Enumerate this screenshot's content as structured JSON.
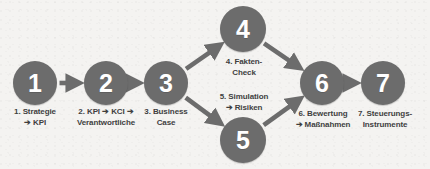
{
  "diagram": {
    "background_color": "#f4f3f1",
    "node_color": "#6c6c6c",
    "node_number_color": "#ffffff",
    "label_color": "#3f3f3f",
    "arrow_color": "#6c6c6c",
    "type": "flow",
    "nodes": [
      {
        "id": "node-1",
        "number": "1",
        "label": "1. Strategie\n➔ KPI",
        "cx": 35,
        "cy": 83,
        "r": 22,
        "label_x": 0,
        "label_y": 107,
        "label_w": 70
      },
      {
        "id": "node-2",
        "number": "2",
        "label": "2. KPI ➔ KCI ➔\nVerantwortliche",
        "cx": 106,
        "cy": 83,
        "r": 22,
        "label_x": 64,
        "label_y": 107,
        "label_w": 84
      },
      {
        "id": "node-3",
        "number": "3",
        "label": "3. Business\nCase",
        "cx": 166,
        "cy": 83,
        "r": 22,
        "label_x": 131,
        "label_y": 107,
        "label_w": 70
      },
      {
        "id": "node-4",
        "number": "4",
        "label": "4. Fakten-\nCheck",
        "cx": 243,
        "cy": 29,
        "r": 23,
        "label_x": 214,
        "label_y": 57,
        "label_w": 60
      },
      {
        "id": "node-5",
        "number": "5",
        "label": "5. Simulation\n➔ Risiken",
        "cx": 243,
        "cy": 140,
        "r": 23,
        "label_x": 210,
        "label_y": 92,
        "label_w": 68
      },
      {
        "id": "node-6",
        "number": "6",
        "label": "6. Bewertung\n➔ Maßnahmen",
        "cx": 322,
        "cy": 83,
        "r": 22,
        "label_x": 283,
        "label_y": 109,
        "label_w": 80
      },
      {
        "id": "node-7",
        "number": "7",
        "label": "7. Steuerungs-\nInstrumente",
        "cx": 383,
        "cy": 83,
        "r": 22,
        "label_x": 347,
        "label_y": 109,
        "label_w": 76
      }
    ],
    "edges": [
      {
        "id": "edge-1-2",
        "from": "node-1",
        "to": "node-2"
      },
      {
        "id": "edge-2-3",
        "from": "node-2",
        "to": "node-3"
      },
      {
        "id": "edge-3-4",
        "from": "node-3",
        "to": "node-4"
      },
      {
        "id": "edge-3-5",
        "from": "node-3",
        "to": "node-5"
      },
      {
        "id": "edge-4-6",
        "from": "node-4",
        "to": "node-6"
      },
      {
        "id": "edge-5-6",
        "from": "node-5",
        "to": "node-6"
      },
      {
        "id": "edge-6-7",
        "from": "node-6",
        "to": "node-7"
      }
    ]
  }
}
